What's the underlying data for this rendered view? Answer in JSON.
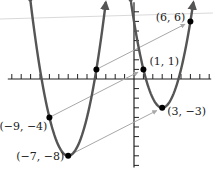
{
  "chart_data": {
    "type": "line",
    "title": "",
    "xlabel": "",
    "ylabel": "",
    "xlim": [
      -13,
      8
    ],
    "ylim": [
      -9,
      8
    ],
    "grid": false,
    "x_ticks_step": 1,
    "y_ticks_step": 1,
    "series": [
      {
        "name": "original-parabola",
        "equation": "y = (x + 7)^2 - 8",
        "vertex": [
          -7,
          -8
        ],
        "color": "#555555"
      },
      {
        "name": "translated-parabola",
        "equation": "y = (x - 3)^2 - 3",
        "vertex": [
          3,
          -3
        ],
        "color": "#555555"
      }
    ],
    "translation": [
      10,
      5
    ],
    "points": [
      {
        "x": -9,
        "y": -4,
        "label": "(−9, −4)",
        "anchor": "left-below"
      },
      {
        "x": -7,
        "y": -8,
        "label": "(−7, −8)",
        "anchor": "left"
      },
      {
        "x": -4,
        "y": 1,
        "label": "",
        "anchor": "none"
      },
      {
        "x": 1,
        "y": 1,
        "label": "(1, 1)",
        "anchor": "right-above"
      },
      {
        "x": 3,
        "y": -3,
        "label": "(3, −3)",
        "anchor": "right"
      },
      {
        "x": 6,
        "y": 6,
        "label": "(6, 6)",
        "anchor": "left-above"
      }
    ],
    "arrows": [
      {
        "from": [
          -9,
          -4
        ],
        "to": [
          1,
          1
        ]
      },
      {
        "from": [
          -7,
          -8
        ],
        "to": [
          3,
          -3
        ]
      },
      {
        "from": [
          -4,
          1
        ],
        "to": [
          6,
          6
        ]
      }
    ],
    "colors": {
      "curve": "#555555",
      "arrow": "#a8a8a8",
      "axis": "#222222",
      "point": "#000000"
    }
  }
}
